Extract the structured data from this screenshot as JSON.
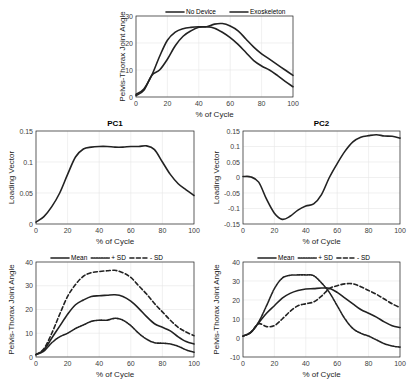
{
  "chart_data": [
    {
      "id": "top",
      "type": "line",
      "title": "",
      "xlabel": "% of Cycle",
      "ylabel": "Pelvis-Thorax Joint Angle",
      "xlim": [
        0,
        100
      ],
      "ylim": [
        0,
        30
      ],
      "xticks": [
        0,
        20,
        40,
        60,
        80,
        100
      ],
      "yticks": [
        0,
        10,
        20,
        30
      ],
      "grid": true,
      "legend": "top",
      "x": [
        0,
        5,
        10,
        15,
        20,
        25,
        30,
        35,
        40,
        45,
        50,
        55,
        60,
        65,
        70,
        75,
        80,
        85,
        90,
        95,
        100
      ],
      "series": [
        {
          "name": "No Device",
          "style": "solid",
          "values": [
            1,
            3,
            8,
            15,
            21,
            24,
            25.3,
            25.8,
            26,
            26,
            25.5,
            24,
            22,
            19.5,
            16.5,
            13.5,
            11.5,
            10,
            8,
            5.8,
            3.8
          ]
        },
        {
          "name": "Exoskeleton",
          "style": "solid",
          "values": [
            0.5,
            2.5,
            8,
            10,
            14,
            19,
            22.5,
            24.5,
            25.8,
            26,
            27,
            27.2,
            26.3,
            24.5,
            21.5,
            18.5,
            16,
            14,
            12,
            10,
            8
          ]
        }
      ]
    },
    {
      "id": "pc1",
      "type": "line",
      "title": "PC1",
      "xlabel": "% of Cycle",
      "ylabel": "Loading Vector",
      "xlim": [
        0,
        100
      ],
      "ylim": [
        0,
        0.15
      ],
      "xticks": [
        0,
        20,
        40,
        60,
        80,
        100
      ],
      "yticks": [
        0,
        0.05,
        0.1,
        0.15
      ],
      "ytick_labels": [
        "0",
        "0.05",
        "0.1",
        "0.15"
      ],
      "grid": true,
      "x": [
        0,
        5,
        10,
        15,
        20,
        25,
        30,
        35,
        40,
        45,
        50,
        55,
        60,
        65,
        70,
        75,
        80,
        85,
        90,
        95,
        100
      ],
      "series": [
        {
          "name": "PC1",
          "style": "solid",
          "values": [
            0.003,
            0.012,
            0.028,
            0.05,
            0.08,
            0.108,
            0.121,
            0.124,
            0.125,
            0.125,
            0.124,
            0.124,
            0.125,
            0.125,
            0.126,
            0.12,
            0.1,
            0.08,
            0.065,
            0.055,
            0.046
          ]
        }
      ]
    },
    {
      "id": "pc2",
      "type": "line",
      "title": "PC2",
      "xlabel": "% of Cycle",
      "ylabel": "Loading Vector",
      "xlim": [
        0,
        100
      ],
      "ylim": [
        -0.15,
        0.15
      ],
      "xticks": [
        0,
        20,
        40,
        60,
        80,
        100
      ],
      "yticks": [
        -0.15,
        -0.1,
        -0.05,
        0,
        0.05,
        0.1,
        0.15
      ],
      "ytick_labels": [
        "-0.15",
        "-0.1",
        "-0.05",
        "0",
        "0.05",
        "0.1",
        "0.15"
      ],
      "grid": true,
      "x": [
        0,
        5,
        10,
        15,
        20,
        25,
        30,
        35,
        40,
        45,
        50,
        55,
        60,
        65,
        70,
        75,
        80,
        85,
        90,
        95,
        100
      ],
      "series": [
        {
          "name": "PC2",
          "style": "solid",
          "values": [
            0.003,
            0.002,
            -0.015,
            -0.07,
            -0.115,
            -0.135,
            -0.125,
            -0.105,
            -0.092,
            -0.085,
            -0.055,
            0,
            0.045,
            0.085,
            0.115,
            0.13,
            0.135,
            0.138,
            0.134,
            0.133,
            0.127
          ]
        }
      ]
    },
    {
      "id": "bl",
      "type": "line",
      "title": "",
      "xlabel": "% of Cycle",
      "ylabel": "Pelvis-Thorax Joint Angle",
      "xlim": [
        0,
        100
      ],
      "ylim": [
        0,
        40
      ],
      "xticks": [
        0,
        20,
        40,
        60,
        80,
        100
      ],
      "yticks": [
        0,
        10,
        20,
        30,
        40
      ],
      "grid": true,
      "legend": "top",
      "x": [
        0,
        5,
        10,
        15,
        20,
        25,
        30,
        35,
        40,
        45,
        50,
        55,
        60,
        65,
        70,
        75,
        80,
        85,
        90,
        95,
        100
      ],
      "series": [
        {
          "name": "Mean",
          "style": "solid",
          "values": [
            1,
            3,
            8,
            13,
            18,
            22,
            24,
            25.5,
            25.8,
            26,
            26.2,
            25.5,
            23.5,
            20.5,
            17,
            14,
            12.5,
            11,
            8.5,
            6.5,
            5.5
          ]
        },
        {
          "name": "+ SD",
          "style": "dashdot",
          "values": [
            1,
            2.5,
            6,
            8.5,
            10,
            12,
            13.5,
            15,
            15.5,
            15.5,
            16.3,
            15.5,
            13.2,
            10,
            7.5,
            6,
            5.8,
            5.5,
            4.5,
            3,
            2
          ]
        },
        {
          "name": "- SD",
          "style": "dashed",
          "values": [
            1,
            3.5,
            10,
            18,
            25.5,
            30.5,
            34,
            35.5,
            36,
            36.3,
            36.5,
            35.5,
            33.5,
            30,
            26.5,
            22.5,
            19,
            15.5,
            12.5,
            10.5,
            9
          ]
        }
      ]
    },
    {
      "id": "br",
      "type": "line",
      "title": "",
      "xlabel": "% of Cycle",
      "ylabel": "Pelvis-Thorax Joint Angle",
      "xlim": [
        0,
        100
      ],
      "ylim": [
        -10,
        40
      ],
      "xticks": [
        0,
        20,
        40,
        60,
        80,
        100
      ],
      "yticks": [
        -10,
        0,
        10,
        20,
        30,
        40
      ],
      "grid": true,
      "legend": "top",
      "x": [
        0,
        5,
        10,
        15,
        20,
        25,
        30,
        35,
        40,
        45,
        50,
        55,
        60,
        65,
        70,
        75,
        80,
        85,
        90,
        95,
        100
      ],
      "series": [
        {
          "name": "Mean",
          "style": "solid",
          "values": [
            1,
            3,
            8,
            13,
            17,
            21,
            23.5,
            25,
            25.8,
            26,
            26.3,
            26.2,
            24,
            21,
            18,
            15,
            13,
            11,
            8.5,
            6.5,
            5.5
          ]
        },
        {
          "name": "+ SD",
          "style": "dashdot",
          "values": [
            1,
            3,
            8.5,
            17,
            26,
            31.5,
            33,
            33.2,
            33.2,
            32.8,
            29,
            24,
            17,
            10,
            5,
            2.5,
            1,
            -1,
            -3,
            -4.2,
            -4.8
          ]
        },
        {
          "name": "- SD",
          "style": "dashed",
          "values": [
            1,
            3,
            7.5,
            6,
            6.5,
            10,
            14,
            17,
            18,
            19,
            22,
            26,
            27.5,
            28.5,
            28.5,
            27,
            25,
            23,
            20.5,
            18,
            16
          ]
        }
      ]
    }
  ]
}
